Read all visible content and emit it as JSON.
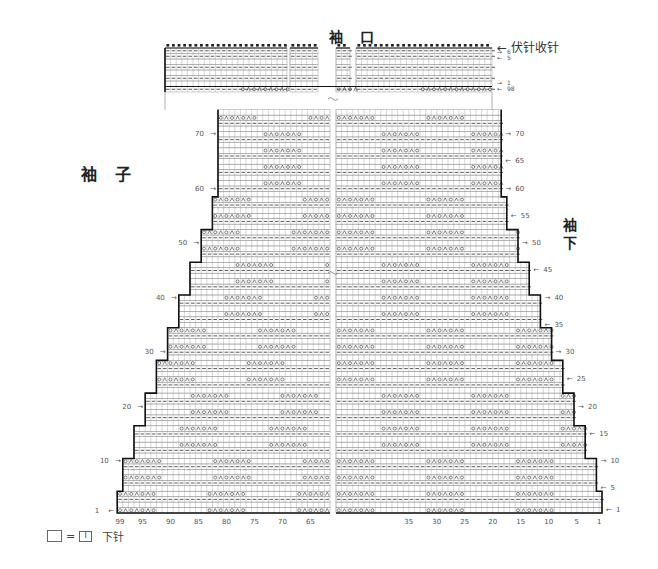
{
  "labels": {
    "top_title": "袖 口",
    "left_title": "袖 子",
    "right_title_chars": [
      "袖",
      "下"
    ],
    "bind_off_note": "伏针收针",
    "legend_equals": "=",
    "legend_knit_symbol": "I",
    "legend_text": "下针"
  },
  "colors": {
    "grid": "#9a9a9a",
    "outline": "#111111",
    "symbol": "#333333",
    "text": "#555555"
  },
  "chart_data": {
    "type": "knitting-chart",
    "stitch_axis_labels": [
      "99",
      "95",
      "90",
      "85",
      "80",
      "75",
      "70",
      "65",
      "35",
      "30",
      "25",
      "20",
      "15",
      "10",
      "5",
      "1"
    ],
    "row_labels_left": [
      1,
      10,
      20,
      30,
      40,
      50,
      60,
      70
    ],
    "row_labels_right": [
      1,
      5,
      10,
      15,
      20,
      25,
      30,
      35,
      40,
      45,
      50,
      55,
      60,
      65,
      70
    ],
    "cuff_row_labels": [
      "6",
      "5",
      "1",
      "98"
    ],
    "symbols": {
      "blank": "下针 (knit)",
      "dash": "上针 (purl)",
      "o": "挂针 (yarn over)",
      "k2tog": "左上2针并1针",
      "bindoff": "伏针收针"
    },
    "total_rows_body": 98,
    "cuff_rows": 6,
    "stitches_max": 99,
    "break_marks": [
      "~",
      "~"
    ]
  }
}
